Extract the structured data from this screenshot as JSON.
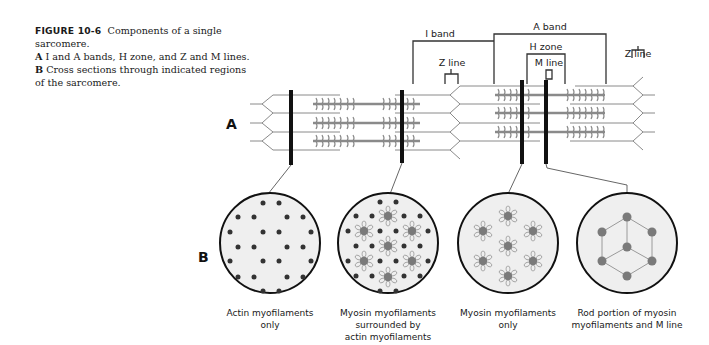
{
  "caption": {
    "figure_label": "FIGURE 10-6",
    "title": "Components of a single sarcomere.",
    "line_a_letter": "A",
    "line_a_text": "I and A bands, H zone, and Z and M lines.",
    "line_b_letter": "B",
    "line_b_text": "Cross sections through indicated regions",
    "line_b_text2": "of the sarcomere."
  },
  "panels": {
    "a": "A",
    "b": "B"
  },
  "labels": {
    "i_band": "I band",
    "a_band": "A band",
    "h_zone": "H zone",
    "m_line": "M line",
    "z_line_left": "Z line",
    "z_line_right": "Z line"
  },
  "cross_sections": [
    {
      "id": "actin-only",
      "line1": "Actin myofilaments",
      "line2": "only",
      "line3": ""
    },
    {
      "id": "myosin-actin",
      "line1": "Myosin myofilaments",
      "line2": "surrounded by",
      "line3": "actin myofilaments"
    },
    {
      "id": "myosin-only",
      "line1": "Myosin myofilaments",
      "line2": "only",
      "line3": ""
    },
    {
      "id": "rod-m-line",
      "line1": "Rod portion of myosin",
      "line2": "myofilaments and M line",
      "line3": ""
    }
  ],
  "colors": {
    "ink": "#111111",
    "filament": "#8a8a8a",
    "myosin_dot": "#7a7a7a",
    "circle_fill": "#efefef"
  }
}
